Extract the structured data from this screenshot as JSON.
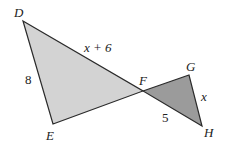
{
  "diagram": {
    "colors": {
      "large_triangle_fill": "#d3d3d3",
      "small_triangle_fill": "#9b9b9b",
      "stroke": "#2a2a2a",
      "text": "#222222"
    },
    "vertices": {
      "D": {
        "label": "D",
        "x": 23,
        "y": 21
      },
      "E": {
        "label": "E",
        "x": 53,
        "y": 124
      },
      "F": {
        "label": "F",
        "x": 143,
        "y": 91
      },
      "G": {
        "label": "G",
        "x": 189,
        "y": 75
      },
      "H": {
        "label": "H",
        "x": 202,
        "y": 126
      }
    },
    "triangles": [
      {
        "name": "DEF",
        "points": [
          "D",
          "E",
          "F"
        ],
        "shade": "light"
      },
      {
        "name": "FGH",
        "points": [
          "F",
          "G",
          "H"
        ],
        "shade": "dark"
      }
    ],
    "side_labels": {
      "DF": "x + 6",
      "DE": "8",
      "FH": "5",
      "GH": "x"
    }
  }
}
